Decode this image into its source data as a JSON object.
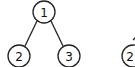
{
  "diagram": {
    "type": "binary-tree",
    "stroke_color": "#222222",
    "nodes": [
      {
        "id": "n1",
        "label": "1",
        "cx": 44,
        "cy": 12
      },
      {
        "id": "n2",
        "label": "2",
        "cx": 19,
        "cy": 56
      },
      {
        "id": "n3",
        "label": "3",
        "cx": 69,
        "cy": 56
      },
      {
        "id": "n4",
        "label": "2",
        "cx": 129,
        "cy": 56
      }
    ],
    "edges": [
      {
        "from": "n1",
        "to": "n2"
      },
      {
        "from": "n1",
        "to": "n3"
      }
    ]
  }
}
